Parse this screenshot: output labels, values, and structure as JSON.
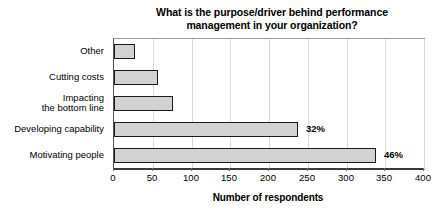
{
  "chart_data": {
    "type": "bar",
    "orientation": "horizontal",
    "title": "What is the purpose/driver behind performance management in your organization?",
    "title_line1": "What is the purpose/driver behind performance",
    "title_line2": "management in your organization?",
    "xlabel": "Number of respondents",
    "ylabel": "",
    "xlim": [
      0,
      400
    ],
    "xticks": [
      0,
      50,
      100,
      150,
      200,
      250,
      300,
      350,
      400
    ],
    "xtick_labels": [
      "0",
      "50",
      "100",
      "150",
      "200",
      "250",
      "300",
      "350",
      "400"
    ],
    "grid": true,
    "grid_axis": "x",
    "legend": false,
    "categories": [
      "Other",
      "Cutting costs",
      "Impacting the bottom line",
      "Developing capability",
      "Motivating people"
    ],
    "category_lines": [
      [
        "Other"
      ],
      [
        "Cutting costs"
      ],
      [
        "Impacting",
        "the bottom line"
      ],
      [
        "Developing capability"
      ],
      [
        "Motivating people"
      ]
    ],
    "values": [
      27,
      57,
      76,
      237,
      338
    ],
    "data_labels": [
      "",
      "",
      "",
      "32%",
      "46%"
    ],
    "bars": [
      {
        "category": "Other",
        "value": 27,
        "label": ""
      },
      {
        "category": "Cutting costs",
        "value": 57,
        "label": ""
      },
      {
        "category": "Impacting the bottom line",
        "value": 76,
        "label": ""
      },
      {
        "category": "Developing capability",
        "value": 237,
        "label": "32%"
      },
      {
        "category": "Motivating people",
        "value": 338,
        "label": "46%"
      }
    ],
    "colors": {
      "bar_fill": "#d2d2d2",
      "bar_border": "#1a1a1a",
      "gridline": "#d9d9d9",
      "axis": "#3a3a3a",
      "plot_border": "#9a9a9a",
      "text": "#000000",
      "background": "#ffffff"
    }
  }
}
